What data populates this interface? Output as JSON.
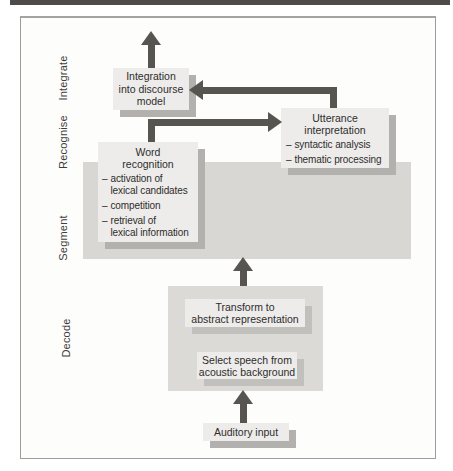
{
  "diagram": {
    "stage_labels": [
      "Integrate",
      "Recognise",
      "Segment",
      "Decode"
    ],
    "dash": "–",
    "boxes": {
      "integration": {
        "text": "Integration\ninto discourse\nmodel"
      },
      "word_recognition": {
        "title": "Word\nrecognition",
        "items": [
          "activation of\nlexical candidates",
          "competition",
          "retrieval of\nlexical information"
        ]
      },
      "utterance": {
        "title": "Utterance\ninterpretation",
        "items": [
          "syntactic analysis",
          "thematic processing"
        ]
      },
      "transform": {
        "text": "Transform to\nabstract representation"
      },
      "select_speech": {
        "text": "Select speech from\nacoustic background"
      },
      "auditory": {
        "text": "Auditory input"
      }
    },
    "colors": {
      "top_bar": "#4e4c4a",
      "frame_border": "#9d9d9b",
      "band": "#d8d7d4",
      "box_fill": "#edecea",
      "box_shadow": "#b2b1ae",
      "arrow": "#57554f",
      "text": "#2d2c2a"
    }
  }
}
